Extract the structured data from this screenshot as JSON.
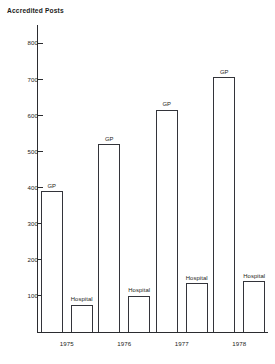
{
  "chart_data": {
    "type": "bar",
    "title": "Accredited Posts",
    "xlabel": "",
    "ylabel": "",
    "ylim": [
      0,
      850
    ],
    "grid": false,
    "legend_position": "inline-above-bars",
    "categories": [
      "1975",
      "1976",
      "1977",
      "1978"
    ],
    "y_ticks": [
      100,
      200,
      300,
      400,
      500,
      600,
      700,
      800
    ],
    "y_tick_labels": [
      "100",
      "200",
      "300",
      "400",
      "500",
      "600",
      "700",
      "800"
    ],
    "series": [
      {
        "name": "GP",
        "values": [
          390,
          520,
          615,
          705
        ]
      },
      {
        "name": "Hospital",
        "values": [
          75,
          100,
          135,
          140
        ]
      }
    ],
    "bar_annotations": [
      {
        "series": "GP",
        "category": "1975",
        "label": "GP"
      },
      {
        "series": "Hospital",
        "category": "1975",
        "label": "Hospital"
      },
      {
        "series": "GP",
        "category": "1976",
        "label": "GP"
      },
      {
        "series": "Hospital",
        "category": "1976",
        "label": "Hospital"
      },
      {
        "series": "GP",
        "category": "1977",
        "label": "GP"
      },
      {
        "series": "Hospital",
        "category": "1977",
        "label": "Hospital"
      },
      {
        "series": "GP",
        "category": "1978",
        "label": "GP"
      },
      {
        "series": "Hospital",
        "category": "1978",
        "label": "Hospital"
      }
    ],
    "colors": {
      "bar_fill": "#ffffff",
      "bar_stroke": "#33343a",
      "axis": "#2b2c30",
      "text": "#1b1c20",
      "background": "#ffffff"
    }
  }
}
